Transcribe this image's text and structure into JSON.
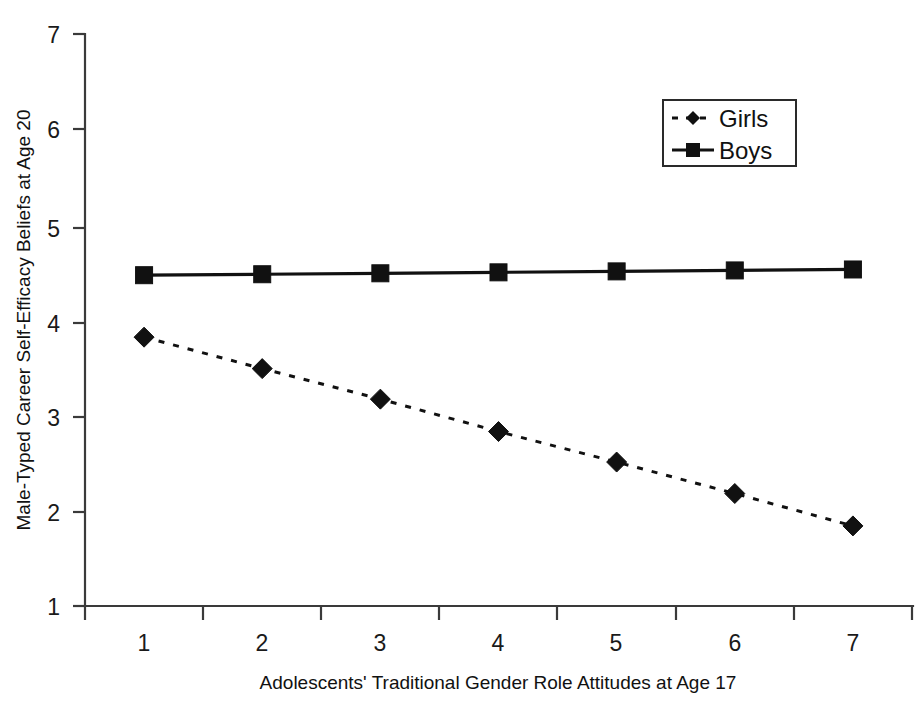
{
  "chart_data": {
    "type": "line",
    "title": "",
    "subtitle": "",
    "xlabel": "Adolescents'  Traditional Gender Role Attitudes at Age 17",
    "ylabel": "Male-Typed Career Self-Efficacy Beliefs at Age 20",
    "x": [
      1,
      2,
      3,
      4,
      5,
      6,
      7
    ],
    "categories": [
      "1",
      "2",
      "3",
      "4",
      "5",
      "6",
      "7"
    ],
    "xtick_labels": [
      "1",
      "2",
      "3",
      "4",
      "5",
      "6",
      "7"
    ],
    "ytick_labels": [
      "1",
      "2",
      "3",
      "4",
      "5",
      "6",
      "7"
    ],
    "xlim": [
      0.5,
      7.5
    ],
    "ylim": [
      1,
      7
    ],
    "grid": false,
    "legend_position": "top-right",
    "series": [
      {
        "name": "Girls",
        "values": [
          3.82,
          3.49,
          3.17,
          2.83,
          2.51,
          2.18,
          1.84
        ],
        "line_style": "dashed",
        "marker": "diamond",
        "color": "#111111"
      },
      {
        "name": "Boys",
        "values": [
          4.47,
          4.48,
          4.49,
          4.5,
          4.51,
          4.52,
          4.53
        ],
        "line_style": "solid",
        "marker": "square",
        "color": "#111111"
      }
    ]
  },
  "legend": {
    "items": [
      {
        "label": "Girls",
        "marker": "diamond-marker",
        "style": "dashed"
      },
      {
        "label": "Boys",
        "marker": "square-marker",
        "style": "solid"
      }
    ]
  },
  "axes": {
    "x_title": "Adolescents'  Traditional Gender Role Attitudes at Age 17",
    "y_title": "Male-Typed Career Self-Efficacy Beliefs at Age 20"
  }
}
